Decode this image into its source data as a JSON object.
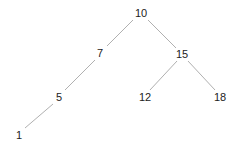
{
  "diagram": {
    "type": "binary-search-tree",
    "edge_color": "#b0b0b0",
    "label_color": "#222222",
    "nodes": [
      {
        "id": "n10",
        "label": "10",
        "x": 141,
        "y": 13
      },
      {
        "id": "n7",
        "label": "7",
        "x": 100,
        "y": 53
      },
      {
        "id": "n15",
        "label": "15",
        "x": 182,
        "y": 54
      },
      {
        "id": "n5",
        "label": "5",
        "x": 59,
        "y": 97
      },
      {
        "id": "n12",
        "label": "12",
        "x": 145,
        "y": 97
      },
      {
        "id": "n18",
        "label": "18",
        "x": 220,
        "y": 97
      },
      {
        "id": "n1",
        "label": "1",
        "x": 19,
        "y": 135
      }
    ],
    "edges": [
      {
        "from": "10",
        "to": "7",
        "x1": 133,
        "y1": 20,
        "x2": 107,
        "y2": 46
      },
      {
        "from": "10",
        "to": "15",
        "x1": 148,
        "y1": 20,
        "x2": 176,
        "y2": 48
      },
      {
        "from": "7",
        "to": "5",
        "x1": 95,
        "y1": 60,
        "x2": 65,
        "y2": 90
      },
      {
        "from": "15",
        "to": "12",
        "x1": 177,
        "y1": 61,
        "x2": 150,
        "y2": 90
      },
      {
        "from": "15",
        "to": "18",
        "x1": 188,
        "y1": 61,
        "x2": 215,
        "y2": 90
      },
      {
        "from": "5",
        "to": "1",
        "x1": 53,
        "y1": 104,
        "x2": 25,
        "y2": 128
      }
    ]
  }
}
